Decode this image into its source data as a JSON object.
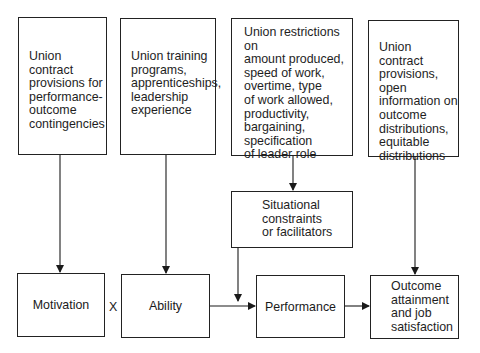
{
  "diagram": {
    "top_boxes": [
      {
        "id": "contract-contingencies",
        "text": "Union contract\nprovisions for\nperformance-\noutcome\ncontingencies"
      },
      {
        "id": "training",
        "text": "Union training\nprograms,\napprenticeships,\nleadership\nexperience"
      },
      {
        "id": "restrictions",
        "text": "Union restrictions on\namount produced,\nspeed of work,\novertime, type\nof work allowed,\nproductivity,\nbargaining,\nspecification\nof leader role"
      },
      {
        "id": "open-information",
        "text": "Union contract\nprovisions, open\ninformation on\noutcome\ndistributions,\nequitable\ndistributions"
      }
    ],
    "situational": {
      "text": "Situational\nconstraints\nor facilitators"
    },
    "bottom_boxes": [
      {
        "id": "motivation",
        "text": "Motivation"
      },
      {
        "id": "ability",
        "text": "Ability"
      },
      {
        "id": "performance",
        "text": "Performance"
      },
      {
        "id": "outcome",
        "text": "Outcome\nattainment\nand job\nsatisfaction"
      }
    ],
    "operator": "X"
  }
}
